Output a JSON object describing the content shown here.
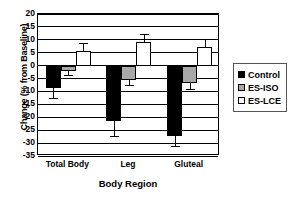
{
  "chart_data": {
    "type": "bar",
    "title": "",
    "xlabel": "Body Region",
    "ylabel": "Change (% from Baseline)",
    "categories": [
      "Total Body",
      "Leg",
      "Gluteal"
    ],
    "ylim": [
      -35,
      20
    ],
    "ytick_step": 5,
    "yticks": [
      "20",
      "15",
      "10",
      "5",
      "0",
      "-5",
      "-10",
      "-15",
      "-20",
      "-25",
      "-30",
      "-35"
    ],
    "grid": true,
    "legend_position": "right",
    "series": [
      {
        "name": "Control",
        "color": "#000000",
        "values": [
          -8.8,
          -21.5,
          -27.3
        ],
        "errors": [
          4.0,
          5.8,
          4.2
        ]
      },
      {
        "name": "ES-ISO",
        "color": "#a8a8a8",
        "values": [
          -2.2,
          -5.5,
          -6.8
        ],
        "errors": [
          1.8,
          2.0,
          2.4
        ]
      },
      {
        "name": "ES-LCE",
        "color": "#ffffff",
        "values": [
          5.5,
          9.2,
          7.1
        ],
        "errors": [
          3.2,
          3.0,
          3.0
        ]
      }
    ]
  },
  "legend": {
    "items": [
      {
        "label": "Control",
        "swatch": "control"
      },
      {
        "label": "ES-ISO",
        "swatch": "iso"
      },
      {
        "label": "ES-LCE",
        "swatch": "lce"
      }
    ]
  }
}
